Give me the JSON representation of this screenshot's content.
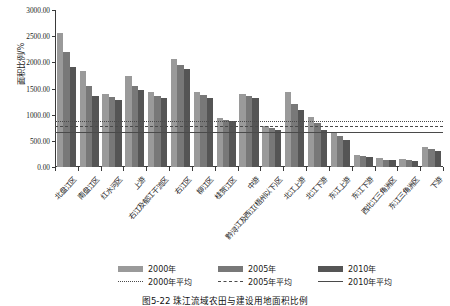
{
  "figure": {
    "caption": "图5-22  珠江流域农田与建设用地面积比例"
  },
  "chart_data": {
    "type": "bar",
    "title": "",
    "xlabel": "",
    "ylabel": "面积比例/%",
    "ylim": [
      0,
      3000
    ],
    "yticks": [
      "0.00",
      "500.00",
      "1000.00",
      "1500.00",
      "2000.00",
      "2500.00",
      "3000.00"
    ],
    "ytick_values": [
      0,
      500,
      1000,
      1500,
      2000,
      2500,
      3000
    ],
    "grid": false,
    "legend_position": "bottom",
    "categories": [
      "北盘江区",
      "南盘江区",
      "红水河区",
      "上游",
      "右江及郁江干流区",
      "右江区",
      "柳江区",
      "桂贺江区",
      "中游",
      "黔浔江及西江(梧州以下)区",
      "北江上游",
      "北江下游",
      "东江上游",
      "东江下游",
      "西北江三角洲区",
      "东江三角洲区",
      "下游"
    ],
    "series": [
      {
        "name": "2000年",
        "color": "#9a9a9a",
        "values": [
          2570,
          1835,
          1390,
          1730,
          1430,
          2060,
          1430,
          935,
          1400,
          790,
          1440,
          965,
          655,
          230,
          170,
          150,
          385
        ]
      },
      {
        "name": "2005年",
        "color": "#787878",
        "values": [
          2200,
          1545,
          1345,
          1550,
          1355,
          1945,
          1385,
          905,
          1355,
          745,
          1205,
          845,
          590,
          205,
          140,
          130,
          335
        ]
      },
      {
        "name": "2010年",
        "color": "#555555",
        "values": [
          1915,
          1355,
          1290,
          1465,
          1320,
          1865,
          1320,
          880,
          1320,
          700,
          1090,
          715,
          510,
          190,
          125,
          115,
          300
        ]
      }
    ],
    "reference_lines": [
      {
        "name": "2000年平均",
        "value": 885,
        "style": "dotted",
        "color": "#4a4a4a"
      },
      {
        "name": "2005年平均",
        "value": 775,
        "style": "dashed",
        "color": "#4a4a4a"
      },
      {
        "name": "2010年平均",
        "value": 670,
        "style": "solid",
        "color": "#4a4a4a"
      }
    ]
  },
  "legend": {
    "bars": [
      "2000年",
      "2005年",
      "2010年"
    ],
    "lines": [
      "2000年平均",
      "2005年平均",
      "2010年平均"
    ]
  }
}
